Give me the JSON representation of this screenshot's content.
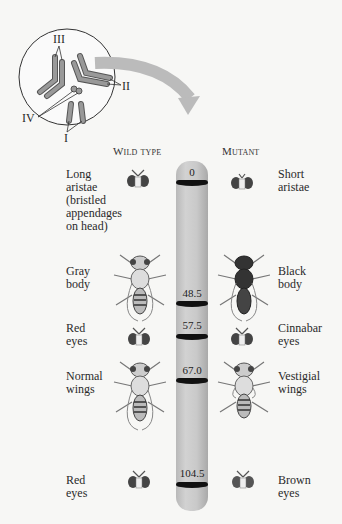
{
  "inset": {
    "chromosome_labels": [
      "III",
      "II",
      "IV",
      "I"
    ]
  },
  "headers": {
    "wild_type": "Wild type",
    "mutant": "Mutant"
  },
  "chromosome": {
    "color": "#c4c4c4",
    "band_color": "#111111",
    "loci": [
      {
        "position": "0",
        "wild": [
          "Long",
          "aristae",
          "(bristled",
          "appendages",
          "on head)"
        ],
        "mutant": [
          "Short",
          "aristae"
        ],
        "icon": "fly-head-icon"
      },
      {
        "position": "48.5",
        "wild": [
          "Gray",
          "body"
        ],
        "mutant": [
          "Black",
          "body"
        ],
        "icon": "fly-body-icon"
      },
      {
        "position": "57.5",
        "wild": [
          "Red",
          "eyes"
        ],
        "mutant": [
          "Cinnabar",
          "eyes"
        ],
        "icon": "fly-head-icon"
      },
      {
        "position": "67.0",
        "wild": [
          "Normal",
          "wings"
        ],
        "mutant": [
          "Vestigial",
          "wings"
        ],
        "icon": "fly-body-icon"
      },
      {
        "position": "104.5",
        "wild": [
          "Red",
          "eyes"
        ],
        "mutant": [
          "Brown",
          "eyes"
        ],
        "icon": "fly-head-icon"
      }
    ]
  }
}
